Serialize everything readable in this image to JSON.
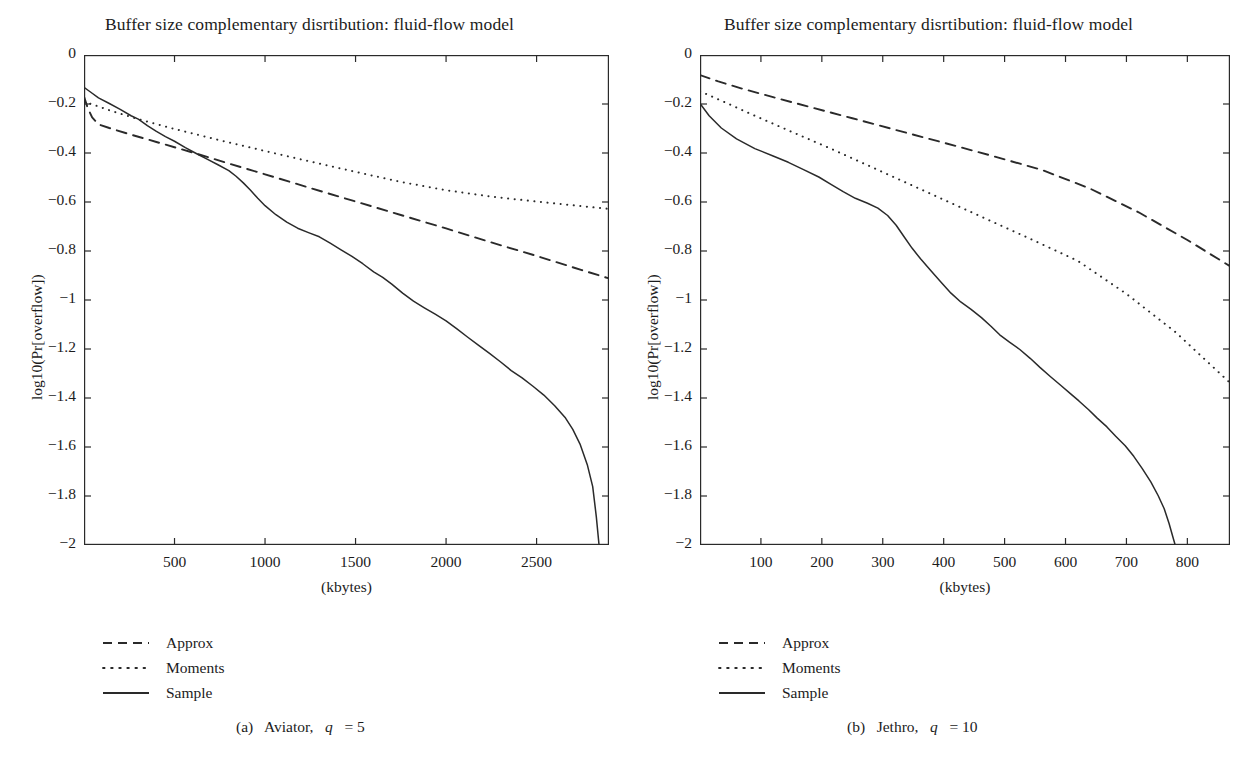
{
  "figure": {
    "background_color": "#ffffff",
    "ink_color": "#2a2a2a",
    "panels": [
      {
        "id": "panel-a",
        "title": "Buffer size complementary disrtibution: fluid-flow model",
        "subcaption_prefix": "(a)",
        "subcaption_name": "Aviator,",
        "subcaption_var": "q",
        "subcaption_eq": "= 5",
        "legend": [
          {
            "label": "Approx",
            "style": "dashed"
          },
          {
            "label": "Moments",
            "style": "dotted"
          },
          {
            "label": "Sample",
            "style": "solid"
          }
        ],
        "chart_data": {
          "type": "line",
          "title": "Buffer size complementary disrtibution: fluid-flow model",
          "xlabel": "(kbytes)",
          "ylabel": "log10(Pr[overflow])",
          "xlim": [
            0,
            2900
          ],
          "ylim": [
            -2,
            0
          ],
          "xticks": [
            500,
            1000,
            1500,
            2000,
            2500
          ],
          "xticklabels": [
            "500",
            "1000",
            "1500",
            "2000",
            "2500"
          ],
          "yticks": [
            0,
            -0.2,
            -0.4,
            -0.6,
            -0.8,
            -1,
            -1.2,
            -1.4,
            -1.6,
            -1.8,
            -2
          ],
          "yticklabels": [
            "0",
            "−0.2",
            "−0.4",
            "−0.6",
            "−0.8",
            "−1",
            "−1.2",
            "−1.4",
            "−1.6",
            "−1.8",
            "−2"
          ],
          "grid": false,
          "legend_position": "below-left",
          "series": [
            {
              "name": "Approx",
              "style": "dashed",
              "x": [
                0,
                20,
                45,
                80,
                140,
                250,
                400,
                600,
                800,
                1000,
                1250,
                1500,
                1750,
                2000,
                2250,
                2500,
                2750,
                2900
              ],
              "y": [
                -0.17,
                -0.215,
                -0.255,
                -0.283,
                -0.298,
                -0.323,
                -0.355,
                -0.398,
                -0.443,
                -0.487,
                -0.543,
                -0.598,
                -0.653,
                -0.708,
                -0.765,
                -0.82,
                -0.878,
                -0.912
              ]
            },
            {
              "name": "Moments",
              "style": "dotted",
              "x": [
                0,
                60,
                150,
                300,
                500,
                750,
                1000,
                1250,
                1500,
                1750,
                2000,
                2250,
                2500,
                2750,
                2900
              ],
              "y": [
                -0.19,
                -0.205,
                -0.228,
                -0.262,
                -0.302,
                -0.348,
                -0.392,
                -0.435,
                -0.477,
                -0.518,
                -0.552,
                -0.578,
                -0.598,
                -0.617,
                -0.628
              ]
            },
            {
              "name": "Sample",
              "style": "solid",
              "x": [
                0,
                30,
                80,
                140,
                200,
                260,
                300,
                350,
                400,
                450,
                500,
                560,
                620,
                680,
                740,
                800,
                840,
                880,
                920,
                960,
                1000,
                1060,
                1120,
                1180,
                1240,
                1300,
                1360,
                1420,
                1480,
                1540,
                1600,
                1650,
                1700,
                1760,
                1820,
                1880,
                1940,
                2000,
                2060,
                2120,
                2180,
                2240,
                2300,
                2360,
                2420,
                2480,
                2540,
                2600,
                2660,
                2700,
                2740,
                2780,
                2810,
                2830,
                2845
              ],
              "y": [
                -0.132,
                -0.148,
                -0.175,
                -0.198,
                -0.222,
                -0.248,
                -0.262,
                -0.288,
                -0.312,
                -0.333,
                -0.352,
                -0.378,
                -0.402,
                -0.425,
                -0.448,
                -0.472,
                -0.495,
                -0.522,
                -0.552,
                -0.585,
                -0.615,
                -0.652,
                -0.682,
                -0.707,
                -0.725,
                -0.742,
                -0.768,
                -0.795,
                -0.822,
                -0.852,
                -0.885,
                -0.908,
                -0.935,
                -0.972,
                -1.005,
                -1.032,
                -1.058,
                -1.085,
                -1.118,
                -1.152,
                -1.185,
                -1.218,
                -1.252,
                -1.288,
                -1.318,
                -1.352,
                -1.388,
                -1.432,
                -1.482,
                -1.528,
                -1.588,
                -1.672,
                -1.762,
                -1.885,
                -2.0
              ]
            }
          ]
        }
      },
      {
        "id": "panel-b",
        "title": "Buffer size complementary disrtibution: fluid-flow model",
        "subcaption_prefix": "(b)",
        "subcaption_name": "Jethro,",
        "subcaption_var": "q",
        "subcaption_eq": "= 10",
        "legend": [
          {
            "label": "Approx",
            "style": "dashed"
          },
          {
            "label": "Moments",
            "style": "dotted"
          },
          {
            "label": "Sample",
            "style": "solid"
          }
        ],
        "chart_data": {
          "type": "line",
          "title": "Buffer size complementary disrtibution: fluid-flow model",
          "xlabel": "(kbytes)",
          "ylabel": "log10(Pr[overflow])",
          "xlim": [
            0,
            870
          ],
          "ylim": [
            -2,
            0
          ],
          "xticks": [
            100,
            200,
            300,
            400,
            500,
            600,
            700,
            800
          ],
          "xticklabels": [
            "100",
            "200",
            "300",
            "400",
            "500",
            "600",
            "700",
            "800"
          ],
          "yticks": [
            0,
            -0.2,
            -0.4,
            -0.6,
            -0.8,
            -1,
            -1.2,
            -1.4,
            -1.6,
            -1.8,
            -2
          ],
          "yticklabels": [
            "0",
            "−0.2",
            "−0.4",
            "−0.6",
            "−0.8",
            "−1",
            "−1.2",
            "−1.4",
            "−1.6",
            "−1.8",
            "−2"
          ],
          "grid": false,
          "legend_position": "below-left",
          "series": [
            {
              "name": "Approx",
              "style": "dashed",
              "x": [
                0,
                30,
                70,
                120,
                180,
                250,
                320,
                400,
                480,
                560,
                640,
                720,
                800,
                870
              ],
              "y": [
                -0.082,
                -0.108,
                -0.138,
                -0.172,
                -0.212,
                -0.258,
                -0.305,
                -0.358,
                -0.412,
                -0.468,
                -0.545,
                -0.642,
                -0.755,
                -0.862
              ]
            },
            {
              "name": "Moments",
              "style": "dotted",
              "x": [
                0,
                40,
                90,
                150,
                220,
                300,
                380,
                460,
                540,
                620,
                700,
                780,
                870
              ],
              "y": [
                -0.148,
                -0.192,
                -0.248,
                -0.313,
                -0.388,
                -0.478,
                -0.568,
                -0.658,
                -0.748,
                -0.84,
                -0.975,
                -1.13,
                -1.338
              ]
            },
            {
              "name": "Sample",
              "style": "solid",
              "x": [
                0,
                15,
                35,
                60,
                90,
                120,
                145,
                170,
                195,
                215,
                235,
                255,
                275,
                292,
                308,
                322,
                335,
                348,
                362,
                378,
                395,
                412,
                428,
                445,
                462,
                478,
                492,
                508,
                525,
                542,
                558,
                575,
                592,
                608,
                622,
                638,
                652,
                668,
                682,
                698,
                712,
                726,
                740,
                752,
                762,
                770,
                776,
                780
              ],
              "y": [
                -0.198,
                -0.248,
                -0.298,
                -0.342,
                -0.382,
                -0.412,
                -0.438,
                -0.468,
                -0.498,
                -0.528,
                -0.558,
                -0.585,
                -0.605,
                -0.625,
                -0.655,
                -0.695,
                -0.742,
                -0.788,
                -0.832,
                -0.878,
                -0.925,
                -0.972,
                -1.008,
                -1.038,
                -1.072,
                -1.108,
                -1.142,
                -1.172,
                -1.202,
                -1.238,
                -1.275,
                -1.312,
                -1.348,
                -1.382,
                -1.412,
                -1.448,
                -1.482,
                -1.518,
                -1.555,
                -1.595,
                -1.638,
                -1.688,
                -1.742,
                -1.798,
                -1.852,
                -1.912,
                -1.965,
                -2.0
              ]
            }
          ]
        }
      }
    ]
  }
}
